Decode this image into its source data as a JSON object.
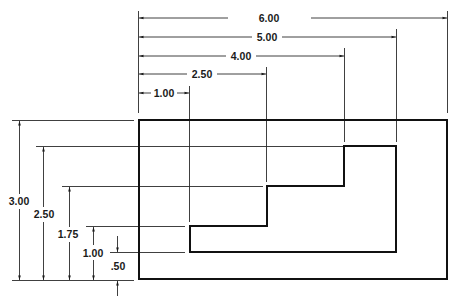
{
  "drawing": {
    "type": "dimensioned technical drawing",
    "units": "inches",
    "horizontal_dimensions": [
      {
        "label": "1.00",
        "value": 1.0
      },
      {
        "label": "2.50",
        "value": 2.5
      },
      {
        "label": "4.00",
        "value": 4.0
      },
      {
        "label": "5.00",
        "value": 5.0
      },
      {
        "label": "6.00",
        "value": 6.0
      }
    ],
    "vertical_dimensions": [
      {
        "label": "3.00",
        "value": 3.0
      },
      {
        "label": "2.50",
        "value": 2.5
      },
      {
        "label": "1.75",
        "value": 1.75
      },
      {
        "label": "1.00",
        "value": 1.0
      },
      {
        "label": ".50",
        "value": 0.5
      }
    ],
    "outer_rectangle": {
      "width": 6.0,
      "height": 3.0
    },
    "inner_stepped_profile_points": [
      [
        1.0,
        0.5
      ],
      [
        1.0,
        1.0
      ],
      [
        2.5,
        1.0
      ],
      [
        2.5,
        1.75
      ],
      [
        4.0,
        1.75
      ],
      [
        4.0,
        2.5
      ],
      [
        5.0,
        2.5
      ],
      [
        5.0,
        0.5
      ]
    ],
    "line_color": "#111111",
    "background": "#ffffff"
  }
}
